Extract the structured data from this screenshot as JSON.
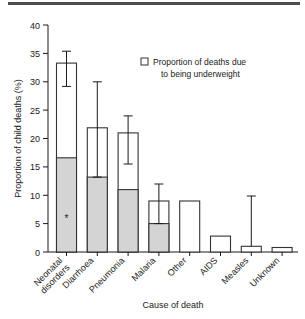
{
  "figure": {
    "legend": {
      "marker": "open-square",
      "line1": "Proportion of deaths due",
      "line2": "to being underweight"
    },
    "annotation_symbol": "*"
  },
  "chart_data": {
    "type": "bar",
    "title": "",
    "xlabel": "Cause of death",
    "ylabel": "Proportion of child deaths (%)",
    "ylim": [
      0,
      40
    ],
    "yticks": [
      0,
      5,
      10,
      15,
      20,
      25,
      30,
      35,
      40
    ],
    "ytick_labels": [
      "0",
      "5",
      "10",
      "15",
      "20",
      "25",
      "30",
      "35",
      "40"
    ],
    "grid": false,
    "legend_position": "upper-right-inside",
    "categories": [
      "Neonatal disorders",
      "Diarrhoea",
      "Pneumonia",
      "Malaria",
      "Other",
      "AIDS",
      "Measles",
      "Unknown"
    ],
    "series": [
      {
        "name": "Proportion of child deaths",
        "values": [
          33.3,
          21.9,
          21.0,
          9.0,
          9.0,
          2.8,
          1.0,
          0.8
        ]
      },
      {
        "name": "Proportion of deaths due to being underweight",
        "values": [
          16.6,
          13.2,
          11.0,
          5.0,
          0,
          0,
          0,
          0
        ]
      }
    ],
    "error_bars": [
      {
        "category": "Neonatal disorders",
        "low": 29.2,
        "high": 35.4
      },
      {
        "category": "Diarrhoea",
        "low": 13.2,
        "high": 30.0
      },
      {
        "category": "Pneumonia",
        "low": 15.5,
        "high": 24.0
      },
      {
        "category": "Malaria",
        "low": 5.0,
        "high": 12.0
      },
      {
        "category": "Other",
        "low": null,
        "high": null
      },
      {
        "category": "AIDS",
        "low": null,
        "high": null
      },
      {
        "category": "Measles",
        "low": 1.0,
        "high": 9.0
      },
      {
        "category": "Unknown",
        "low": null,
        "high": null
      }
    ],
    "annotations": [
      {
        "category": "Neonatal disorders",
        "value": 6.0,
        "symbol": "*"
      }
    ]
  }
}
